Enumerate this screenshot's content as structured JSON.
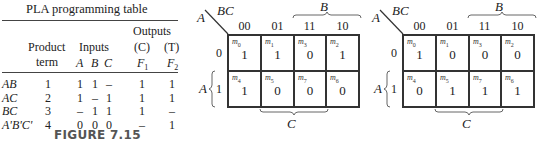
{
  "table": {
    "title": "PLA programming table",
    "headers": {
      "product_term": [
        "Product",
        "term"
      ],
      "inputs": "Inputs",
      "input_vars": [
        "A",
        "B",
        "C"
      ],
      "outputs": "Outputs",
      "output_labels": [
        "(C)",
        "(T)"
      ],
      "output_vars": [
        "F1",
        "F2"
      ]
    },
    "rows": [
      {
        "term": "AB",
        "num": "1",
        "A": "1",
        "B": "1",
        "C": "–",
        "F1": "1",
        "F2": "1"
      },
      {
        "term": "AC",
        "num": "2",
        "A": "1",
        "B": "–",
        "C": "1",
        "F1": "1",
        "F2": "1"
      },
      {
        "term": "BC",
        "num": "3",
        "A": "–",
        "B": "1",
        "C": "1",
        "F1": "1",
        "F2": "–"
      },
      {
        "term": "A'B'C'",
        "num": "4",
        "A": "0",
        "B": "0",
        "C": "0",
        "F1": "–",
        "F2": "1"
      }
    ]
  },
  "caption": "FIGURE 7.15",
  "kmaps": [
    {
      "row_var": "A",
      "col_var": "BC",
      "col_labels": [
        "00",
        "01",
        "11",
        "10"
      ],
      "row_labels": [
        "0",
        "1"
      ],
      "brace_top": "B",
      "brace_bottom": "C",
      "brace_left": "A",
      "minterms": [
        [
          "m0",
          "m1",
          "m3",
          "m2"
        ],
        [
          "m4",
          "m5",
          "m7",
          "m6"
        ]
      ],
      "values": [
        [
          "1",
          "1",
          "0",
          "1"
        ],
        [
          "1",
          "0",
          "0",
          "0"
        ]
      ]
    },
    {
      "row_var": "A",
      "col_var": "BC",
      "col_labels": [
        "00",
        "01",
        "11",
        "10"
      ],
      "row_labels": [
        "0",
        "1"
      ],
      "brace_top": "B",
      "brace_bottom": "C",
      "brace_left": "A",
      "minterms": [
        [
          "m0",
          "m1",
          "m3",
          "m2"
        ],
        [
          "m4",
          "m5",
          "m7",
          "m6"
        ]
      ],
      "values": [
        [
          "1",
          "0",
          "0",
          "0"
        ],
        [
          "0",
          "1",
          "1",
          "1"
        ]
      ]
    }
  ]
}
